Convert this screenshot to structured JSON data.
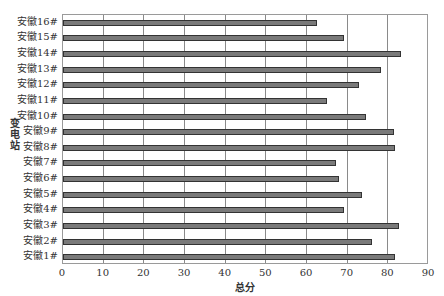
{
  "chart_data": {
    "type": "bar",
    "orientation": "horizontal",
    "title": "",
    "xlabel": "总分",
    "ylabel": "变电站",
    "xlim": [
      0,
      90
    ],
    "xticks": [
      0,
      10,
      20,
      30,
      40,
      50,
      60,
      70,
      80,
      90
    ],
    "grid": "vertical",
    "legend": null,
    "bar_color": "#7a7a7a",
    "categories": [
      "安徽1#",
      "安徽2#",
      "安徽3#",
      "安徽4#",
      "安徽5#",
      "安徽6#",
      "安徽7#",
      "安徽8#",
      "安徽9#",
      "安徽10#",
      "安徽11#",
      "安徽12#",
      "安徽13#",
      "安徽14#",
      "安徽15#",
      "安徽16#"
    ],
    "values": [
      81.7,
      76.0,
      82.5,
      69.2,
      73.6,
      67.8,
      67.1,
      81.7,
      81.3,
      74.6,
      65.0,
      72.7,
      78.2,
      83.0,
      69.0,
      62.4
    ]
  }
}
